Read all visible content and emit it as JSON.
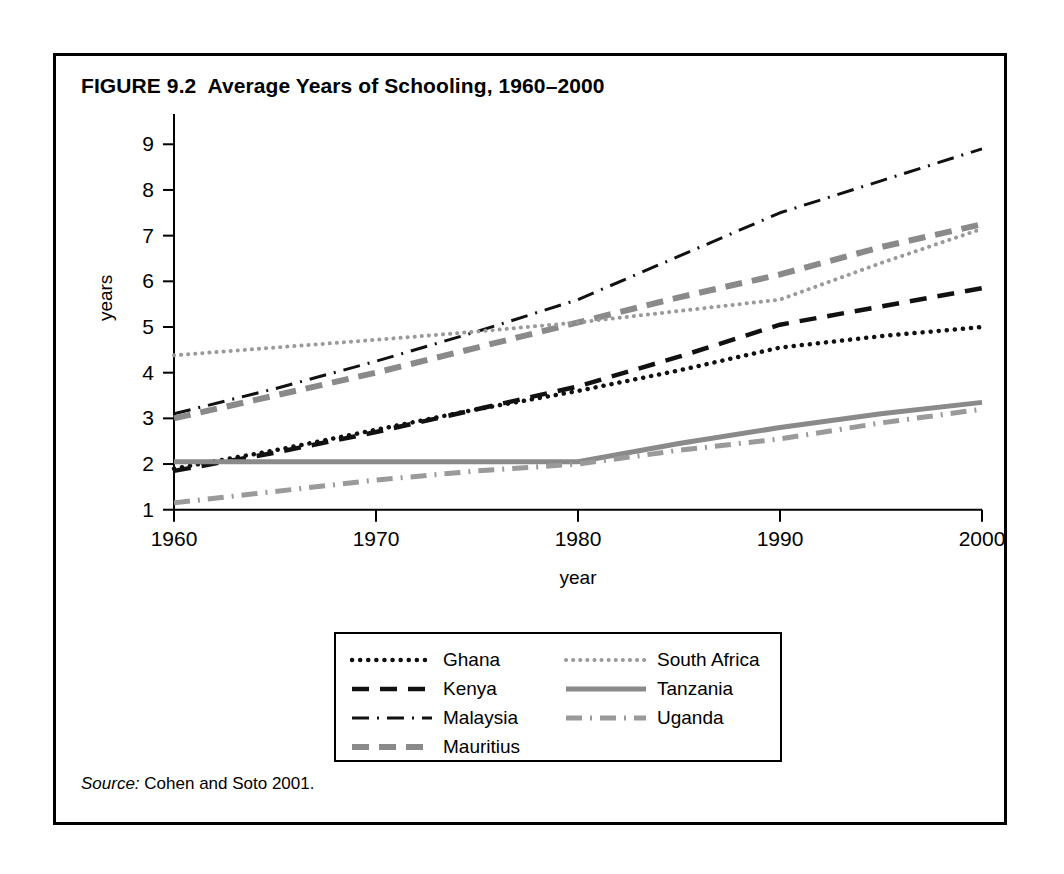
{
  "figure": {
    "title": "FIGURE 9.2  Average Years of Schooling, 1960–2000",
    "source_prefix": "Source:",
    "source_text": " Cohen and Soto 2001."
  },
  "chart_data": {
    "type": "line",
    "title": "Average Years of Schooling, 1960–2000",
    "xlabel": "year",
    "ylabel": "years",
    "xlim": [
      1960,
      2000
    ],
    "ylim": [
      0.6,
      9.4
    ],
    "xticks": [
      1960,
      1970,
      1980,
      1990,
      2000
    ],
    "yticks": [
      1,
      2,
      3,
      4,
      5,
      6,
      7,
      8,
      9
    ],
    "grid": false,
    "legend_position": "bottom-center",
    "x": [
      1960,
      1965,
      1970,
      1975,
      1980,
      1985,
      1990,
      1995,
      2000
    ],
    "series": [
      {
        "name": "Ghana",
        "style": "dotted",
        "color": "#111111",
        "values": [
          1.9,
          2.3,
          2.75,
          3.2,
          3.6,
          4.05,
          4.55,
          4.8,
          5.0
        ]
      },
      {
        "name": "Kenya",
        "style": "dashed",
        "color": "#111111",
        "values": [
          1.85,
          2.25,
          2.7,
          3.2,
          3.7,
          4.35,
          5.05,
          5.45,
          5.85
        ]
      },
      {
        "name": "Malaysia",
        "style": "dash-dot",
        "color": "#111111",
        "values": [
          3.1,
          3.65,
          4.25,
          4.9,
          5.6,
          6.55,
          7.5,
          8.2,
          8.9
        ]
      },
      {
        "name": "Mauritius",
        "style": "thick-dashed",
        "color": "#8a8a8a",
        "values": [
          3.0,
          3.5,
          4.0,
          4.55,
          5.1,
          5.65,
          6.15,
          6.75,
          7.25
        ]
      },
      {
        "name": "South Africa",
        "style": "fine-dotted",
        "color": "#9a9a9a",
        "values": [
          4.38,
          4.55,
          4.72,
          4.9,
          5.1,
          5.35,
          5.6,
          6.4,
          7.15
        ]
      },
      {
        "name": "Tanzania",
        "style": "solid",
        "color": "#8a8a8a",
        "values": [
          2.05,
          2.05,
          2.05,
          2.05,
          2.05,
          2.45,
          2.8,
          3.1,
          3.35
        ]
      },
      {
        "name": "Uganda",
        "style": "gray-dash-dot",
        "color": "#9a9a9a",
        "values": [
          1.15,
          1.4,
          1.65,
          1.85,
          2.0,
          2.3,
          2.55,
          2.9,
          3.2
        ]
      }
    ]
  },
  "legend": {
    "left_items": [
      "Ghana",
      "Kenya",
      "Malaysia",
      "Mauritius"
    ],
    "right_items": [
      "South Africa",
      "Tanzania",
      "Uganda"
    ]
  }
}
